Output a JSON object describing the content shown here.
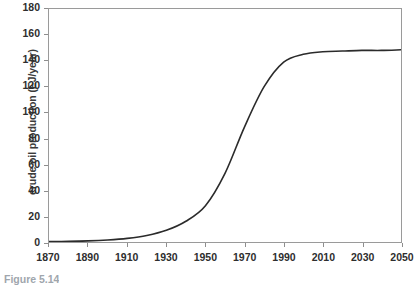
{
  "chart_data": {
    "type": "line",
    "title": "",
    "xlabel": "",
    "ylabel": "crude oil production (EJ/year)",
    "xlim": [
      1870,
      2050
    ],
    "ylim": [
      0,
      180
    ],
    "grid": false,
    "legend": "none",
    "x_ticks": [
      1870,
      1890,
      1910,
      1930,
      1950,
      1970,
      1990,
      2010,
      2030,
      2050
    ],
    "y_ticks": [
      0,
      20,
      40,
      60,
      80,
      100,
      120,
      140,
      160,
      180
    ],
    "series": [
      {
        "name": "crude oil production",
        "color": "#2b2b2b",
        "x": [
          1870,
          1880,
          1890,
          1900,
          1910,
          1920,
          1930,
          1940,
          1950,
          1960,
          1970,
          1980,
          1990,
          2000,
          2010,
          2020,
          2030,
          2040,
          2050
        ],
        "values": [
          0.3,
          0.5,
          0.9,
          1.6,
          2.8,
          5.0,
          9.0,
          16.0,
          28.0,
          53.0,
          89.0,
          120.0,
          139.0,
          145.0,
          147.0,
          147.5,
          148.0,
          148.0,
          148.5
        ]
      }
    ]
  },
  "caption": {
    "text": "Figure 5.14"
  },
  "colors": {
    "curve": "#2b2b2b",
    "frame": "#9a9a9a",
    "tick": "#8e8e8e",
    "label": "#2e2e2e",
    "axis_title": "#3b3b3b",
    "background": "#ffffff"
  }
}
